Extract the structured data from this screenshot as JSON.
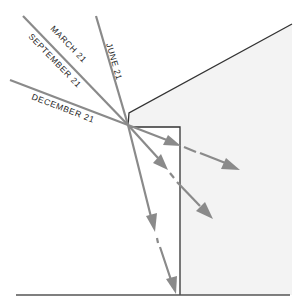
{
  "diagram": {
    "labels": {
      "june": "JUNE 21",
      "march": "MARCH 21",
      "september": "SEPTEMBER 21",
      "december": "DECEMBER 21"
    },
    "colors": {
      "ray": "#8a8a8a",
      "building_fill": "#f3f3f3",
      "edge": "#333333"
    }
  }
}
